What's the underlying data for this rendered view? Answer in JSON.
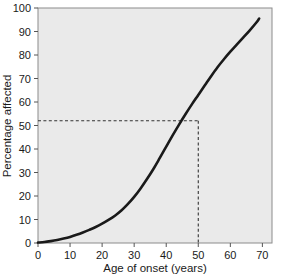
{
  "chart_data": {
    "type": "line",
    "title": "",
    "xlabel": "Age of onset (years)",
    "ylabel": "Percentage affected",
    "xlim": [
      0,
      73
    ],
    "ylim": [
      0,
      100
    ],
    "xticks": [
      0,
      10,
      20,
      30,
      40,
      50,
      60,
      70
    ],
    "xticklabels": [
      "0",
      "10",
      "20",
      "30",
      "40",
      "50",
      "60",
      "70"
    ],
    "yticks": [
      0,
      10,
      20,
      30,
      40,
      50,
      60,
      70,
      80,
      90,
      100
    ],
    "yticklabels": [
      "0",
      "10",
      "20",
      "30",
      "40",
      "50",
      "60",
      "70",
      "80",
      "90",
      "100"
    ],
    "grid": false,
    "legend": false,
    "plot_background": "#eaeaea",
    "line_color": "#1a1a1a",
    "series": [
      {
        "name": "Cumulative percentage affected",
        "x": [
          0,
          2,
          4,
          6,
          8,
          10,
          12,
          14,
          16,
          18,
          20,
          22,
          24,
          26,
          28,
          30,
          32,
          34,
          36,
          38,
          40,
          42,
          44,
          46,
          48,
          50,
          52,
          54,
          56,
          58,
          60,
          62,
          64,
          66,
          68,
          69
        ],
        "y": [
          0.2,
          0.4,
          0.8,
          1.3,
          1.9,
          2.6,
          3.5,
          4.5,
          5.6,
          6.8,
          8.2,
          9.8,
          11.6,
          13.8,
          16.5,
          19.6,
          23.2,
          27.2,
          31.5,
          36.2,
          41.0,
          45.8,
          50.4,
          54.8,
          59.0,
          63.0,
          67.0,
          71.0,
          74.8,
          78.2,
          81.4,
          84.4,
          87.4,
          90.4,
          93.6,
          95.5
        ]
      }
    ],
    "annotations": [
      {
        "name": "median-age-of-onset",
        "type": "crosshair-dashed",
        "x": 50,
        "y": 52,
        "color": "#333333",
        "horizontal_from_x": 0,
        "vertical_to_y": 0
      }
    ]
  },
  "axis": {
    "x_label": "Age of onset (years)",
    "y_label": "Percentage affected"
  }
}
